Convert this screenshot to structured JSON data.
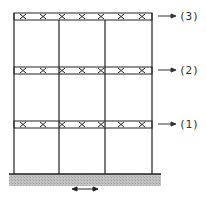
{
  "diagram": {
    "floors": [
      {
        "label": "(3)",
        "level": 3
      },
      {
        "label": "(2)",
        "level": 2
      },
      {
        "label": "(1)",
        "level": 1
      }
    ],
    "bays": 3,
    "columns": 4,
    "ground": {
      "hatched": true,
      "motion": "horizontal-double-arrow"
    },
    "colors": {
      "line": "#222222",
      "ground": "#b8b8b8",
      "text": "#333333"
    }
  }
}
